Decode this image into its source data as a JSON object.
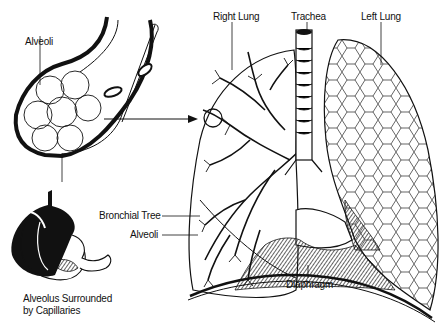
{
  "diagram": {
    "labels": {
      "alveoli_top": "Alveoli",
      "right_lung": "Right Lung",
      "trachea": "Trachea",
      "left_lung": "Left Lung",
      "bronchial_tree": "Bronchial Tree",
      "alveoli_bottom": "Alveoli",
      "alveolus_caption_line1": "Alveolus Surrounded",
      "alveolus_caption_line2": "by Capillaries",
      "diaphragm": "Diaphragm"
    },
    "colors": {
      "ink": "#111111",
      "background": "#ffffff"
    }
  }
}
